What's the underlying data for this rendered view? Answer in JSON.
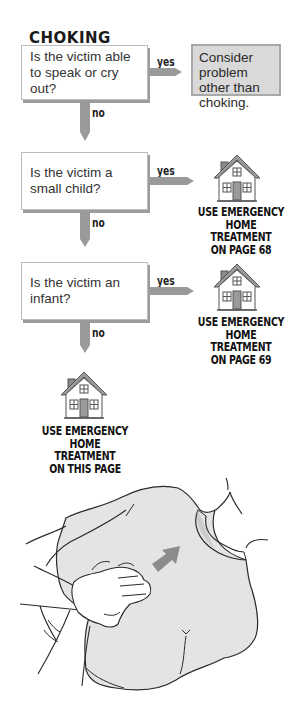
{
  "title": "CHOKING",
  "colors": {
    "arrow": "#9a9a9a",
    "box_shadow": "#9c9c9c",
    "outcome_box_fill": "#d9d9d9",
    "outcome_box_border": "#a9a9a9",
    "illustration_fill": "#e4e4e4",
    "direction_arrow": "#8c8c8c"
  },
  "flowchart": {
    "questions": [
      {
        "text": "Is the victim able to speak or cry out?",
        "yes_label": "yes",
        "no_label": "no"
      },
      {
        "text": "Is the victim a small child?",
        "yes_label": "yes",
        "no_label": "no"
      },
      {
        "text": "Is the victim an infant?",
        "yes_label": "yes",
        "no_label": "no"
      }
    ],
    "outcomes": [
      {
        "type": "text-box",
        "text": "Consider problem other than choking."
      },
      {
        "type": "home-icon",
        "icon": "house-icon",
        "line1": "USE EMERGENCY",
        "line2": "HOME TREATMENT",
        "line3": "ON PAGE 68"
      },
      {
        "type": "home-icon",
        "icon": "house-icon",
        "line1": "USE EMERGENCY",
        "line2": "HOME TREATMENT",
        "line3": "ON PAGE 69"
      },
      {
        "type": "home-icon",
        "icon": "house-icon",
        "line1": "USE EMERGENCY",
        "line2": "HOME TREATMENT",
        "line3": "ON THIS PAGE"
      }
    ]
  },
  "illustration": {
    "description": "hands delivering back blows between shoulder blades of a person in a t-shirt",
    "icon": "back-blow-illustration"
  }
}
